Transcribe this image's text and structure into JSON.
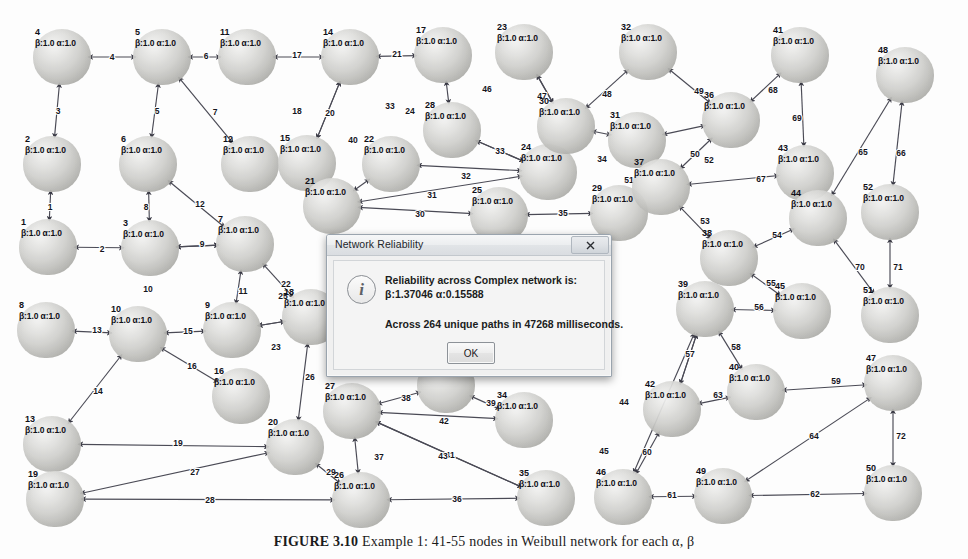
{
  "window": {
    "title": "Network Reliability"
  },
  "dialog": {
    "title": "Network Reliability",
    "close_label": "×",
    "icon": "info-icon",
    "icon_glyph": "i",
    "line1": "Reliability across Complex network is:",
    "line2": "β:1.37046 α:0.15588",
    "line3": "Across 264 unique paths in 47268 milliseconds.",
    "ok_label": "OK",
    "stats": {
      "beta": "1.37046",
      "alpha": "0.15588",
      "unique_paths": 264,
      "elapsed_ms": 47268
    }
  },
  "caption": {
    "figure_label": "FIGURE 3.10",
    "text": "Example 1: 41-55 nodes in Weibull network for each α, β"
  },
  "graph": {
    "node_attr_template": "β:1.0 α:1.0",
    "node_count": 52,
    "edge_count": 72,
    "nodes": [
      {
        "id": "1",
        "attrs": "β:1.0 α:1.0",
        "x": 48,
        "y": 247
      },
      {
        "id": "2",
        "attrs": "β:1.0 α:1.0",
        "x": 52,
        "y": 164
      },
      {
        "id": "3",
        "attrs": "β:1.0 α:1.0",
        "x": 150,
        "y": 248
      },
      {
        "id": "4",
        "attrs": "β:1.0 α:1.0",
        "x": 62,
        "y": 57
      },
      {
        "id": "5",
        "attrs": "β:1.0 α:1.0",
        "x": 162,
        "y": 57
      },
      {
        "id": "6",
        "attrs": "β:1.0 α:1.0",
        "x": 148,
        "y": 164
      },
      {
        "id": "7",
        "attrs": "β:1.0 α:1.0",
        "x": 245,
        "y": 244
      },
      {
        "id": "8",
        "attrs": "β:1.0 α:1.0",
        "x": 46,
        "y": 330
      },
      {
        "id": "9",
        "attrs": "β:1.0 α:1.0",
        "x": 232,
        "y": 330
      },
      {
        "id": "10",
        "attrs": "β:1.0 α:1.0",
        "x": 138,
        "y": 334
      },
      {
        "id": "11",
        "attrs": "β:1.0 α:1.0",
        "x": 247,
        "y": 57
      },
      {
        "id": "12",
        "attrs": "β:1.0 α:1.0",
        "x": 250,
        "y": 164
      },
      {
        "id": "13",
        "attrs": "β:1.0 α:1.0",
        "x": 52,
        "y": 444
      },
      {
        "id": "14",
        "attrs": "β:1.0 α:1.0",
        "x": 350,
        "y": 57
      },
      {
        "id": "15",
        "attrs": "β:1.0 α:1.0",
        "x": 307,
        "y": 163
      },
      {
        "id": "16",
        "attrs": "β:1.0 α:1.0",
        "x": 241,
        "y": 396
      },
      {
        "id": "17",
        "attrs": "β:1.0 α:1.0",
        "x": 443,
        "y": 55
      },
      {
        "id": "18",
        "attrs": "β:1.0 α:1.0",
        "x": 311,
        "y": 317
      },
      {
        "id": "19",
        "attrs": "β:1.0 α:1.0",
        "x": 55,
        "y": 499
      },
      {
        "id": "20",
        "attrs": "β:1.0 α:1.0",
        "x": 295,
        "y": 447
      },
      {
        "id": "21",
        "attrs": "β:1.0 α:1.0",
        "x": 332,
        "y": 206
      },
      {
        "id": "22",
        "attrs": "β:1.0 α:1.0",
        "x": 391,
        "y": 164
      },
      {
        "id": "23",
        "attrs": "β:1.0 α:1.0",
        "x": 524,
        "y": 52
      },
      {
        "id": "24",
        "attrs": "β:1.0 α:1.0",
        "x": 548,
        "y": 172
      },
      {
        "id": "25",
        "attrs": "β:1.0 α:1.0",
        "x": 499,
        "y": 215
      },
      {
        "id": "26",
        "attrs": "β:1.0 α:1.0",
        "x": 361,
        "y": 500
      },
      {
        "id": "27",
        "attrs": "β:1.0 α:1.0",
        "x": 352,
        "y": 411
      },
      {
        "id": "28",
        "attrs": "β:1.0 α:1.0",
        "x": 452,
        "y": 130
      },
      {
        "id": "29",
        "attrs": "β:1.0 α:1.0",
        "x": 619,
        "y": 213
      },
      {
        "id": "30",
        "attrs": "β:1.0 α:1.0",
        "x": 566,
        "y": 126
      },
      {
        "id": "31",
        "attrs": "β:1.0 α:1.0",
        "x": 637,
        "y": 140
      },
      {
        "id": "32",
        "attrs": "β:1.0 α:1.0",
        "x": 648,
        "y": 52
      },
      {
        "id": "33",
        "attrs": "β:1.0 α:1.0",
        "x": 446,
        "y": 385
      },
      {
        "id": "34",
        "attrs": "β:1.0 α:1.0",
        "x": 524,
        "y": 420
      },
      {
        "id": "35",
        "attrs": "β:1.0 α:1.0",
        "x": 546,
        "y": 498
      },
      {
        "id": "36",
        "attrs": "β:1.0 α:1.0",
        "x": 731,
        "y": 120
      },
      {
        "id": "37",
        "attrs": "β:1.0 α:1.0",
        "x": 661,
        "y": 187
      },
      {
        "id": "38",
        "attrs": "β:1.0 α:1.0",
        "x": 729,
        "y": 258
      },
      {
        "id": "39",
        "attrs": "β:1.0 α:1.0",
        "x": 705,
        "y": 309
      },
      {
        "id": "40",
        "attrs": "β:1.0 α:1.0",
        "x": 756,
        "y": 392
      },
      {
        "id": "41",
        "attrs": "β:1.0 α:1.0",
        "x": 800,
        "y": 55
      },
      {
        "id": "42",
        "attrs": "β:1.0 α:1.0",
        "x": 672,
        "y": 409
      },
      {
        "id": "43",
        "attrs": "β:1.0 α:1.0",
        "x": 805,
        "y": 173
      },
      {
        "id": "44",
        "attrs": "β:1.0 α:1.0",
        "x": 818,
        "y": 218
      },
      {
        "id": "45",
        "attrs": "β:1.0 α:1.0",
        "x": 802,
        "y": 311
      },
      {
        "id": "46",
        "attrs": "β:1.0 α:1.0",
        "x": 623,
        "y": 497
      },
      {
        "id": "47",
        "attrs": "β:1.0 α:1.0",
        "x": 893,
        "y": 383
      },
      {
        "id": "48",
        "attrs": "β:1.0 α:1.0",
        "x": 905,
        "y": 75
      },
      {
        "id": "49",
        "attrs": "β:1.0 α:1.0",
        "x": 723,
        "y": 496
      },
      {
        "id": "50",
        "attrs": "β:1.0 α:1.0",
        "x": 893,
        "y": 493
      },
      {
        "id": "51",
        "attrs": "β:1.0 α:1.0",
        "x": 890,
        "y": 315
      },
      {
        "id": "52",
        "attrs": "β:1.0 α:1.0",
        "x": 890,
        "y": 212
      }
    ],
    "edges": [
      {
        "label": "1",
        "from": "2",
        "to": "1",
        "lx": 50,
        "ly": 208
      },
      {
        "label": "2",
        "from": "1",
        "to": "3",
        "lx": 102,
        "ly": 250
      },
      {
        "label": "3",
        "from": "4",
        "to": "2",
        "lx": 58,
        "ly": 112
      },
      {
        "label": "4",
        "from": "4",
        "to": "5",
        "lx": 112,
        "ly": 58
      },
      {
        "label": "5",
        "from": "5",
        "to": "6",
        "lx": 157,
        "ly": 112
      },
      {
        "label": "6",
        "from": "5",
        "to": "11",
        "lx": 206,
        "ly": 57
      },
      {
        "label": "7",
        "from": "5",
        "to": "12",
        "lx": 215,
        "ly": 113
      },
      {
        "label": "8",
        "from": "6",
        "to": "3",
        "lx": 146,
        "ly": 208
      },
      {
        "label": "9",
        "from": "3",
        "to": "7",
        "lx": 202,
        "ly": 245
      },
      {
        "label": "10",
        "from": "3",
        "to": "7",
        "lx": 148,
        "ly": 290
      },
      {
        "label": "11",
        "from": "7",
        "to": "9",
        "lx": 243,
        "ly": 292
      },
      {
        "label": "12",
        "from": "6",
        "to": "7",
        "lx": 200,
        "ly": 205
      },
      {
        "label": "13",
        "from": "8",
        "to": "10",
        "lx": 97,
        "ly": 331
      },
      {
        "label": "14",
        "from": "10",
        "to": "13",
        "lx": 98,
        "ly": 392
      },
      {
        "label": "15",
        "from": "10",
        "to": "9",
        "lx": 188,
        "ly": 332
      },
      {
        "label": "16",
        "from": "10",
        "to": "16",
        "lx": 192,
        "ly": 367
      },
      {
        "label": "17",
        "from": "11",
        "to": "14",
        "lx": 297,
        "ly": 56
      },
      {
        "label": "18",
        "from": "14",
        "to": "15",
        "lx": 297,
        "ly": 112
      },
      {
        "label": "19",
        "from": "13",
        "to": "20",
        "lx": 178,
        "ly": 444
      },
      {
        "label": "20",
        "from": "14",
        "to": "15",
        "lx": 330,
        "ly": 114
      },
      {
        "label": "21",
        "from": "14",
        "to": "17",
        "lx": 397,
        "ly": 55
      },
      {
        "label": "22",
        "from": "18",
        "to": "7",
        "lx": 286,
        "ly": 285
      },
      {
        "label": "23",
        "from": "18",
        "to": "9",
        "lx": 276,
        "ly": 348
      },
      {
        "label": "24",
        "from": "17",
        "to": "28",
        "lx": 410,
        "ly": 112
      },
      {
        "label": "25",
        "from": "9",
        "to": "18",
        "lx": 283,
        "ly": 297
      },
      {
        "label": "26",
        "from": "18",
        "to": "20",
        "lx": 310,
        "ly": 378
      },
      {
        "label": "27",
        "from": "19",
        "to": "20",
        "lx": 195,
        "ly": 473
      },
      {
        "label": "28",
        "from": "19",
        "to": "26",
        "lx": 210,
        "ly": 501
      },
      {
        "label": "29",
        "from": "20",
        "to": "26",
        "lx": 331,
        "ly": 473
      },
      {
        "label": "30",
        "from": "21",
        "to": "25",
        "lx": 420,
        "ly": 215
      },
      {
        "label": "31",
        "from": "21",
        "to": "24",
        "lx": 432,
        "ly": 196
      },
      {
        "label": "32",
        "from": "22",
        "to": "24",
        "lx": 466,
        "ly": 177
      },
      {
        "label": "33",
        "from": "28",
        "to": "24",
        "lx": 390,
        "ly": 107
      },
      {
        "label": "33",
        "from": "28",
        "to": "24",
        "lx": 500,
        "ly": 152
      },
      {
        "label": "34",
        "from": "30",
        "to": "31",
        "lx": 602,
        "ly": 160
      },
      {
        "label": "35",
        "from": "25",
        "to": "29",
        "lx": 563,
        "ly": 214
      },
      {
        "label": "36",
        "from": "26",
        "to": "35",
        "lx": 457,
        "ly": 500
      },
      {
        "label": "37",
        "from": "27",
        "to": "26",
        "lx": 379,
        "ly": 458
      },
      {
        "label": "38",
        "from": "27",
        "to": "33",
        "lx": 406,
        "ly": 399
      },
      {
        "label": "39",
        "from": "33",
        "to": "34",
        "lx": 491,
        "ly": 404
      },
      {
        "label": "40",
        "from": "21",
        "to": "22",
        "lx": 353,
        "ly": 141
      },
      {
        "label": "41",
        "from": "27",
        "to": "35",
        "lx": 450,
        "ly": 456
      },
      {
        "label": "42",
        "from": "27",
        "to": "34",
        "lx": 444,
        "ly": 422
      },
      {
        "label": "43",
        "from": "27",
        "to": "35",
        "lx": 443,
        "ly": 457
      },
      {
        "label": "44",
        "from": "39",
        "to": "42",
        "lx": 624,
        "ly": 403
      },
      {
        "label": "45",
        "from": "39",
        "to": "46",
        "lx": 604,
        "ly": 452
      },
      {
        "label": "46",
        "from": "23",
        "to": "30",
        "lx": 487,
        "ly": 90
      },
      {
        "label": "47",
        "from": "23",
        "to": "30",
        "lx": 542,
        "ly": 97
      },
      {
        "label": "48",
        "from": "30",
        "to": "32",
        "lx": 607,
        "ly": 95
      },
      {
        "label": "49",
        "from": "32",
        "to": "36",
        "lx": 699,
        "ly": 92
      },
      {
        "label": "50",
        "from": "31",
        "to": "36",
        "lx": 695,
        "ly": 155
      },
      {
        "label": "51",
        "from": "29",
        "to": "37",
        "lx": 629,
        "ly": 181
      },
      {
        "label": "52",
        "from": "36",
        "to": "37",
        "lx": 709,
        "ly": 161
      },
      {
        "label": "53",
        "from": "37",
        "to": "38",
        "lx": 705,
        "ly": 222
      },
      {
        "label": "54",
        "from": "38",
        "to": "44",
        "lx": 777,
        "ly": 236
      },
      {
        "label": "55",
        "from": "38",
        "to": "45",
        "lx": 771,
        "ly": 284
      },
      {
        "label": "56",
        "from": "39",
        "to": "45",
        "lx": 759,
        "ly": 308
      },
      {
        "label": "57",
        "from": "39",
        "to": "42",
        "lx": 690,
        "ly": 355
      },
      {
        "label": "58",
        "from": "39",
        "to": "40",
        "lx": 736,
        "ly": 348
      },
      {
        "label": "59",
        "from": "40",
        "to": "47",
        "lx": 836,
        "ly": 382
      },
      {
        "label": "60",
        "from": "42",
        "to": "46",
        "lx": 647,
        "ly": 453
      },
      {
        "label": "61",
        "from": "46",
        "to": "49",
        "lx": 672,
        "ly": 496
      },
      {
        "label": "62",
        "from": "49",
        "to": "50",
        "lx": 815,
        "ly": 495
      },
      {
        "label": "63",
        "from": "42",
        "to": "40",
        "lx": 718,
        "ly": 396
      },
      {
        "label": "64",
        "from": "49",
        "to": "47",
        "lx": 814,
        "ly": 437
      },
      {
        "label": "65",
        "from": "44",
        "to": "48",
        "lx": 863,
        "ly": 153
      },
      {
        "label": "66",
        "from": "48",
        "to": "52",
        "lx": 901,
        "ly": 154
      },
      {
        "label": "67",
        "from": "37",
        "to": "43",
        "lx": 761,
        "ly": 180
      },
      {
        "label": "68",
        "from": "36",
        "to": "41",
        "lx": 773,
        "ly": 91
      },
      {
        "label": "69",
        "from": "41",
        "to": "43",
        "lx": 797,
        "ly": 119
      },
      {
        "label": "70",
        "from": "44",
        "to": "51",
        "lx": 860,
        "ly": 268
      },
      {
        "label": "71",
        "from": "52",
        "to": "51",
        "lx": 898,
        "ly": 268
      },
      {
        "label": "72",
        "from": "47",
        "to": "50",
        "lx": 901,
        "ly": 437
      }
    ]
  },
  "colors": {
    "background": "#fdfdfd",
    "node_fill": "#cfcfcc",
    "edge_stroke": "#4a4a55",
    "text": "#101018",
    "dialog_face": "#f0f0f0"
  }
}
